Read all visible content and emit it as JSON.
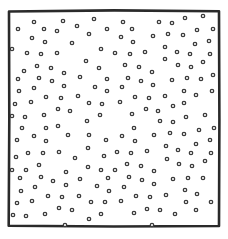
{
  "diagram": {
    "kind": "scatter-dots-in-square",
    "canvas": {
      "width": 228,
      "height": 239,
      "background": "#ffffff"
    },
    "frame": {
      "x1": 9,
      "y1": 11,
      "x2": 219,
      "y2": 226,
      "stroke": "#2a2a2a",
      "stroke_width": 2.6
    },
    "dot_style": {
      "radius": 1.7,
      "stroke": "#3a3a3a",
      "stroke_width": 1.3,
      "fill": "#ffffff"
    },
    "dots": [
      [
        18,
        29
      ],
      [
        34,
        22
      ],
      [
        63,
        21
      ],
      [
        77,
        26
      ],
      [
        94,
        19
      ],
      [
        107,
        29
      ],
      [
        44,
        29
      ],
      [
        57,
        31
      ],
      [
        32,
        38
      ],
      [
        45,
        42
      ],
      [
        72,
        43
      ],
      [
        89,
        34
      ],
      [
        12,
        49
      ],
      [
        27,
        53
      ],
      [
        41,
        54
      ],
      [
        57,
        53
      ],
      [
        101,
        49
      ],
      [
        86,
        61
      ],
      [
        37,
        66
      ],
      [
        51,
        68
      ],
      [
        24,
        71
      ],
      [
        64,
        73
      ],
      [
        99,
        68
      ],
      [
        80,
        77
      ],
      [
        39,
        78
      ],
      [
        52,
        81
      ],
      [
        18,
        79
      ],
      [
        107,
        79
      ],
      [
        34,
        88
      ],
      [
        64,
        86
      ],
      [
        95,
        87
      ],
      [
        19,
        91
      ],
      [
        107,
        91
      ],
      [
        46,
        97
      ],
      [
        61,
        98
      ],
      [
        78,
        96
      ],
      [
        31,
        102
      ],
      [
        15,
        104
      ],
      [
        89,
        103
      ],
      [
        102,
        104
      ],
      [
        58,
        109
      ],
      [
        70,
        111
      ],
      [
        44,
        115
      ],
      [
        25,
        117
      ],
      [
        100,
        115
      ],
      [
        12,
        116
      ],
      [
        123,
        22
      ],
      [
        159,
        22
      ],
      [
        172,
        23
      ],
      [
        185,
        18
      ],
      [
        203,
        16
      ],
      [
        132,
        29
      ],
      [
        197,
        30
      ],
      [
        213,
        29
      ],
      [
        121,
        37
      ],
      [
        133,
        42
      ],
      [
        153,
        36
      ],
      [
        168,
        34
      ],
      [
        183,
        35
      ],
      [
        195,
        44
      ],
      [
        209,
        41
      ],
      [
        165,
        47
      ],
      [
        115,
        53
      ],
      [
        130,
        54
      ],
      [
        145,
        52
      ],
      [
        177,
        52
      ],
      [
        190,
        54
      ],
      [
        210,
        54
      ],
      [
        165,
        59
      ],
      [
        203,
        62
      ],
      [
        125,
        65
      ],
      [
        139,
        67
      ],
      [
        178,
        65
      ],
      [
        191,
        67
      ],
      [
        152,
        72
      ],
      [
        213,
        75
      ],
      [
        128,
        78
      ],
      [
        141,
        81
      ],
      [
        172,
        80
      ],
      [
        187,
        78
      ],
      [
        201,
        79
      ],
      [
        122,
        87
      ],
      [
        153,
        85
      ],
      [
        184,
        91
      ],
      [
        212,
        91
      ],
      [
        135,
        97
      ],
      [
        149,
        98
      ],
      [
        165,
        96
      ],
      [
        196,
        95
      ],
      [
        120,
        102
      ],
      [
        173,
        106
      ],
      [
        184,
        103
      ],
      [
        146,
        109
      ],
      [
        158,
        111
      ],
      [
        132,
        114
      ],
      [
        186,
        117
      ],
      [
        205,
        115
      ],
      [
        22,
        128
      ],
      [
        46,
        128
      ],
      [
        58,
        126
      ],
      [
        87,
        121
      ],
      [
        17,
        140
      ],
      [
        34,
        136
      ],
      [
        46,
        141
      ],
      [
        68,
        135
      ],
      [
        89,
        135
      ],
      [
        106,
        140
      ],
      [
        28,
        153
      ],
      [
        43,
        153
      ],
      [
        59,
        152
      ],
      [
        16,
        157
      ],
      [
        75,
        158
      ],
      [
        88,
        148
      ],
      [
        104,
        156
      ],
      [
        39,
        165
      ],
      [
        12,
        170
      ],
      [
        26,
        170
      ],
      [
        66,
        172
      ],
      [
        88,
        167
      ],
      [
        101,
        170
      ],
      [
        20,
        178
      ],
      [
        41,
        177
      ],
      [
        53,
        181
      ],
      [
        80,
        179
      ],
      [
        66,
        185
      ],
      [
        108,
        178
      ],
      [
        21,
        191
      ],
      [
        35,
        187
      ],
      [
        97,
        186
      ],
      [
        109,
        191
      ],
      [
        48,
        196
      ],
      [
        62,
        197
      ],
      [
        79,
        196
      ],
      [
        17,
        203
      ],
      [
        32,
        201
      ],
      [
        91,
        202
      ],
      [
        105,
        202
      ],
      [
        13,
        215
      ],
      [
        26,
        216
      ],
      [
        45,
        214
      ],
      [
        59,
        208
      ],
      [
        72,
        210
      ],
      [
        89,
        219
      ],
      [
        101,
        214
      ],
      [
        65,
        225
      ],
      [
        134,
        128
      ],
      [
        160,
        121
      ],
      [
        173,
        122
      ],
      [
        122,
        136
      ],
      [
        135,
        141
      ],
      [
        154,
        135
      ],
      [
        170,
        133
      ],
      [
        184,
        134
      ],
      [
        199,
        130
      ],
      [
        214,
        128
      ],
      [
        210,
        140
      ],
      [
        166,
        146
      ],
      [
        196,
        144
      ],
      [
        117,
        152
      ],
      [
        131,
        153
      ],
      [
        147,
        151
      ],
      [
        178,
        150
      ],
      [
        191,
        153
      ],
      [
        211,
        153
      ],
      [
        167,
        159
      ],
      [
        205,
        161
      ],
      [
        127,
        164
      ],
      [
        141,
        166
      ],
      [
        179,
        164
      ],
      [
        192,
        166
      ],
      [
        115,
        170
      ],
      [
        154,
        171
      ],
      [
        129,
        177
      ],
      [
        142,
        180
      ],
      [
        173,
        179
      ],
      [
        188,
        178
      ],
      [
        203,
        178
      ],
      [
        124,
        187
      ],
      [
        154,
        184
      ],
      [
        185,
        190
      ],
      [
        197,
        194
      ],
      [
        136,
        196
      ],
      [
        150,
        197
      ],
      [
        166,
        195
      ],
      [
        121,
        201
      ],
      [
        186,
        202
      ],
      [
        211,
        202
      ],
      [
        147,
        209
      ],
      [
        160,
        210
      ],
      [
        134,
        213
      ],
      [
        175,
        214
      ],
      [
        196,
        210
      ],
      [
        152,
        225
      ]
    ]
  }
}
